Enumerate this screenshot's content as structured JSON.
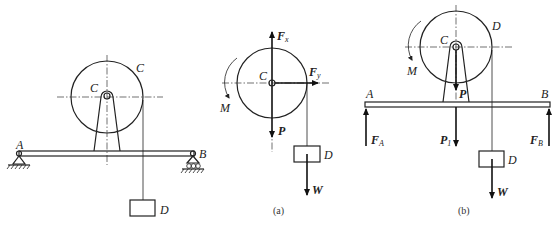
{
  "figure_main": {
    "labels": {
      "wheel_rim": "C",
      "center": "C",
      "support_left": "A",
      "support_right": "B",
      "weight_block": "D"
    }
  },
  "figure_a": {
    "caption": "(a)",
    "labels": {
      "force_vertical": "F",
      "force_vertical_sub": "x",
      "force_horizontal": "F",
      "force_horizontal_sub": "y",
      "center": "C",
      "moment": "M",
      "weight_wheel": "P",
      "block": "D",
      "block_weight": "W"
    }
  },
  "figure_b": {
    "caption": "(b)",
    "labels": {
      "rim_point": "D",
      "center": "C",
      "moment": "M",
      "weight_wheel": "P",
      "beam_left": "A",
      "beam_right": "B",
      "reaction_a": "F",
      "reaction_a_sub": "A",
      "reaction_b": "F",
      "reaction_b_sub": "B",
      "beam_weight": "P",
      "beam_weight_sub": "1",
      "block": "D",
      "block_weight": "W"
    }
  }
}
